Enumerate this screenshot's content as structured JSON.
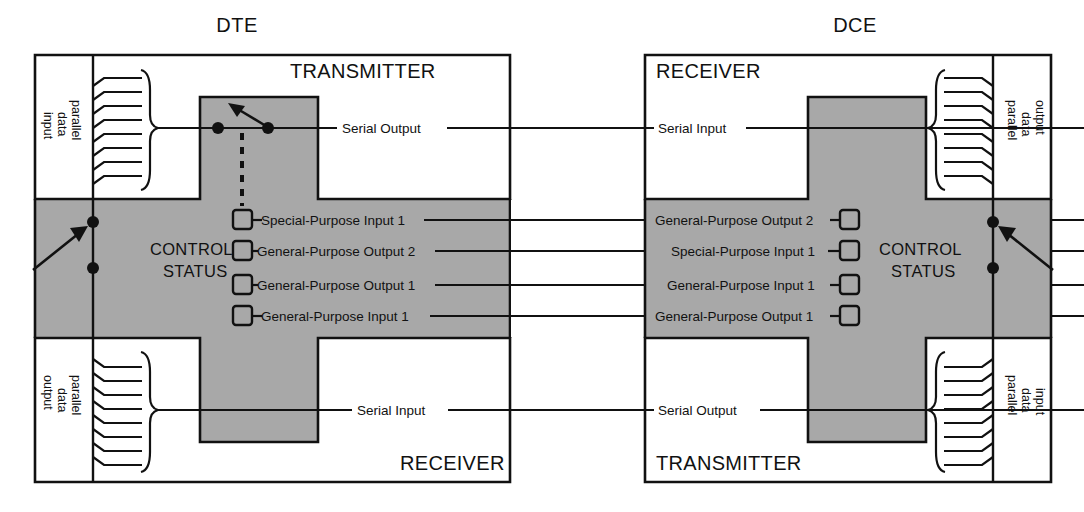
{
  "diagram": {
    "title_left": "DTE",
    "title_right": "DCE",
    "left_unit": {
      "top_section_label": "TRANSMITTER",
      "bottom_section_label": "RECEIVER",
      "control_label_line1": "CONTROL",
      "control_label_line2": "STATUS",
      "top_bus_line1": "parallel",
      "top_bus_line2": "data",
      "top_bus_line3": "input",
      "bottom_bus_line1": "parallel",
      "bottom_bus_line2": "data",
      "bottom_bus_line3": "output",
      "top_serial_label": "Serial Output",
      "bottom_serial_label": "Serial Input",
      "control_signals": [
        "Special-Purpose Input 1",
        "General-Purpose Output 2",
        "General-Purpose Output 1",
        "General-Purpose Input 1"
      ]
    },
    "right_unit": {
      "top_section_label": "RECEIVER",
      "bottom_section_label": "TRANSMITTER",
      "control_label_line1": "CONTROL",
      "control_label_line2": "STATUS",
      "top_bus_line1": "parallel",
      "top_bus_line2": "data",
      "top_bus_line3": "output",
      "bottom_bus_line1": "parallel",
      "bottom_bus_line2": "data",
      "bottom_bus_line3": "input",
      "top_serial_label": "Serial Input",
      "bottom_serial_label": "Serial Output",
      "control_signals": [
        "General-Purpose Output 2",
        "Special-Purpose Input 1",
        "General-Purpose Input 1",
        "General-Purpose Output 1"
      ]
    },
    "colors": {
      "shade": "#a8a8a8",
      "line": "#111111",
      "background": "#ffffff"
    }
  }
}
